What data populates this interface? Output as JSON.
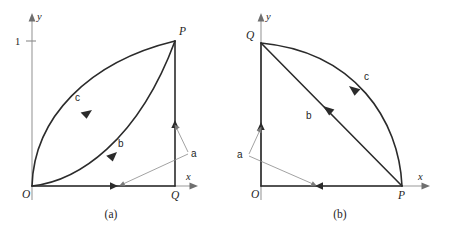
{
  "figure": {
    "background_color": "#ffffff",
    "stroke_color": "#2b2b2b",
    "axis_color": "#9a9a9a",
    "leader_color": "#8a8a8a"
  },
  "panels": [
    {
      "id": "a",
      "caption": "(a)",
      "axes": {
        "x_label": "x",
        "y_label": "y",
        "y_ticks": [
          {
            "label": "1",
            "value": 1
          }
        ]
      },
      "points": [
        {
          "name": "O",
          "label": "O"
        },
        {
          "name": "Q",
          "label": "Q"
        },
        {
          "name": "P",
          "label": "P"
        }
      ],
      "paths": [
        {
          "name": "c",
          "label": "c",
          "description": "upper curved arc from O to P",
          "direction": "O to P"
        },
        {
          "name": "b",
          "label": "b",
          "description": "lower curved arc from O to P",
          "direction": "O to P"
        },
        {
          "name": "a",
          "label": "a",
          "description": "two-segment path O to Q to P",
          "direction": "O to Q to P"
        }
      ]
    },
    {
      "id": "b",
      "caption": "(b)",
      "axes": {
        "x_label": "x",
        "y_label": "y",
        "y_ticks": []
      },
      "points": [
        {
          "name": "O",
          "label": "O"
        },
        {
          "name": "P",
          "label": "P"
        },
        {
          "name": "Q",
          "label": "Q"
        }
      ],
      "paths": [
        {
          "name": "c",
          "label": "c",
          "description": "curved arc from P to Q",
          "direction": "P to Q"
        },
        {
          "name": "b",
          "label": "b",
          "description": "straight chord from P to Q",
          "direction": "P to Q"
        },
        {
          "name": "a",
          "label": "a",
          "description": "two-segment path P to O to Q",
          "direction": "P to O to Q"
        }
      ]
    }
  ]
}
